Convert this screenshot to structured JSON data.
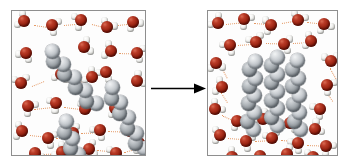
{
  "figure": {
    "title": "Hydrophobic effect: nonpolar chains aggregate in water",
    "background_color": "#ffffff",
    "width": 348,
    "height": 165
  },
  "colors": {
    "oxygen": "#94200f",
    "hydrogen": "#f3f3f1",
    "carbon": "#bcc1c6",
    "carbon_shaded": "#9ba1a6",
    "hydrogen_bond": "#e08a4e",
    "panel_border": "#8e8e8e",
    "panel_fill": "#fdfdfd",
    "arrow": "#000000"
  },
  "panels": [
    {
      "id": "panel-before",
      "name": "dispersed-state-panel",
      "label": "",
      "state": "dispersed",
      "chain_count": 3,
      "water_count": 28,
      "chains": [
        {
          "name": "chain-upper-left",
          "x": 38,
          "y": 42,
          "angle": 50,
          "beads": 9,
          "spacing": 8.6
        },
        {
          "name": "chain-right-middle",
          "x": 98,
          "y": 78,
          "angle": 62,
          "beads": 9,
          "spacing": 8.6
        },
        {
          "name": "chain-lower-center",
          "x": 52,
          "y": 112,
          "angle": 70,
          "beads": 9,
          "spacing": 8.6
        }
      ],
      "waters": [
        {
          "x": 12,
          "y": 10,
          "rot": 205
        },
        {
          "x": 40,
          "y": 14,
          "rot": 25
        },
        {
          "x": 69,
          "y": 9,
          "rot": 160
        },
        {
          "x": 95,
          "y": 16,
          "rot": 300
        },
        {
          "x": 121,
          "y": 11,
          "rot": 60
        },
        {
          "x": 14,
          "y": 42,
          "rot": 120
        },
        {
          "x": 72,
          "y": 36,
          "rot": 340
        },
        {
          "x": 99,
          "y": 40,
          "rot": 200
        },
        {
          "x": 125,
          "y": 42,
          "rot": 15
        },
        {
          "x": 9,
          "y": 72,
          "rot": 260
        },
        {
          "x": 49,
          "y": 63,
          "rot": 100
        },
        {
          "x": 80,
          "y": 66,
          "rot": 215
        },
        {
          "x": 125,
          "y": 70,
          "rot": 330
        },
        {
          "x": 16,
          "y": 95,
          "rot": 40
        },
        {
          "x": 44,
          "y": 92,
          "rot": 150
        },
        {
          "x": 73,
          "y": 98,
          "rot": 285
        },
        {
          "x": 103,
          "y": 97,
          "rot": 70
        },
        {
          "x": 10,
          "y": 120,
          "rot": 190
        },
        {
          "x": 36,
          "y": 127,
          "rot": 20
        },
        {
          "x": 61,
          "y": 122,
          "rot": 245
        },
        {
          "x": 88,
          "y": 119,
          "rot": 130
        },
        {
          "x": 118,
          "y": 120,
          "rot": 310
        },
        {
          "x": 23,
          "y": 142,
          "rot": 85
        },
        {
          "x": 50,
          "y": 141,
          "rot": 215
        },
        {
          "x": 77,
          "y": 138,
          "rot": 350
        },
        {
          "x": 104,
          "y": 142,
          "rot": 160
        },
        {
          "x": 127,
          "y": 132,
          "rot": 55
        },
        {
          "x": 94,
          "y": 61,
          "rot": 125
        }
      ],
      "hbonds": [
        {
          "x": 22,
          "y": 14,
          "len": 16,
          "angle": 8
        },
        {
          "x": 52,
          "y": 14,
          "len": 15,
          "angle": -5
        },
        {
          "x": 80,
          "y": 13,
          "len": 13,
          "angle": 14
        },
        {
          "x": 106,
          "y": 14,
          "len": 13,
          "angle": -6
        },
        {
          "x": 107,
          "y": 42,
          "len": 16,
          "angle": 2
        },
        {
          "x": 20,
          "y": 75,
          "len": 13,
          "angle": -22
        },
        {
          "x": 55,
          "y": 68,
          "len": 19,
          "angle": 9
        },
        {
          "x": 22,
          "y": 98,
          "len": 18,
          "angle": -6
        },
        {
          "x": 52,
          "y": 96,
          "len": 18,
          "angle": 7
        },
        {
          "x": 18,
          "y": 124,
          "len": 15,
          "angle": 6
        },
        {
          "x": 44,
          "y": 127,
          "len": 14,
          "angle": -4
        },
        {
          "x": 69,
          "y": 122,
          "len": 16,
          "angle": -2
        },
        {
          "x": 96,
          "y": 120,
          "len": 18,
          "angle": 2
        },
        {
          "x": 31,
          "y": 143,
          "len": 16,
          "angle": -2
        },
        {
          "x": 58,
          "y": 141,
          "len": 16,
          "angle": -3
        },
        {
          "x": 85,
          "y": 139,
          "len": 16,
          "angle": 5
        },
        {
          "x": 112,
          "y": 141,
          "len": 14,
          "angle": -14
        }
      ]
    },
    {
      "id": "panel-after",
      "name": "aggregated-state-panel",
      "label": "",
      "state": "aggregated",
      "chain_count": 3,
      "water_count": 28,
      "chains": [
        {
          "name": "chain-cluster-left",
          "x": 45,
          "y": 50,
          "angle": 92,
          "beads": 9,
          "spacing": 8.6
        },
        {
          "name": "chain-cluster-center",
          "x": 66,
          "y": 46,
          "angle": 90,
          "beads": 9,
          "spacing": 8.6
        },
        {
          "name": "chain-cluster-right",
          "x": 87,
          "y": 50,
          "angle": 88,
          "beads": 9,
          "spacing": 8.6
        }
      ],
      "waters": [
        {
          "x": 10,
          "y": 12,
          "rot": 220
        },
        {
          "x": 36,
          "y": 8,
          "rot": 40
        },
        {
          "x": 63,
          "y": 14,
          "rot": 170
        },
        {
          "x": 90,
          "y": 9,
          "rot": 290
        },
        {
          "x": 116,
          "y": 13,
          "rot": 70
        },
        {
          "x": 22,
          "y": 34,
          "rot": 130
        },
        {
          "x": 48,
          "y": 31,
          "rot": 250
        },
        {
          "x": 76,
          "y": 33,
          "rot": 10
        },
        {
          "x": 103,
          "y": 30,
          "rot": 195
        },
        {
          "x": 8,
          "y": 52,
          "rot": 85
        },
        {
          "x": 123,
          "y": 50,
          "rot": 265
        },
        {
          "x": 14,
          "y": 76,
          "rot": 200
        },
        {
          "x": 119,
          "y": 74,
          "rot": 35
        },
        {
          "x": 7,
          "y": 98,
          "rot": 315
        },
        {
          "x": 112,
          "y": 98,
          "rot": 145
        },
        {
          "x": 29,
          "y": 110,
          "rot": 60
        },
        {
          "x": 55,
          "y": 108,
          "rot": 230
        },
        {
          "x": 82,
          "y": 112,
          "rot": 105
        },
        {
          "x": 107,
          "y": 118,
          "rot": 330
        },
        {
          "x": 12,
          "y": 124,
          "rot": 180
        },
        {
          "x": 38,
          "y": 130,
          "rot": 25
        },
        {
          "x": 64,
          "y": 127,
          "rot": 255
        },
        {
          "x": 90,
          "y": 132,
          "rot": 140
        },
        {
          "x": 118,
          "y": 135,
          "rot": 45
        },
        {
          "x": 24,
          "y": 146,
          "rot": 215
        },
        {
          "x": 52,
          "y": 145,
          "rot": 95
        },
        {
          "x": 79,
          "y": 143,
          "rot": 345
        },
        {
          "x": 105,
          "y": 146,
          "rot": 165
        }
      ],
      "hbonds": [
        {
          "x": 18,
          "y": 13,
          "len": 17,
          "angle": -6
        },
        {
          "x": 46,
          "y": 12,
          "len": 16,
          "angle": 4
        },
        {
          "x": 74,
          "y": 12,
          "len": 15,
          "angle": -10
        },
        {
          "x": 99,
          "y": 11,
          "len": 16,
          "angle": 6
        },
        {
          "x": 30,
          "y": 34,
          "len": 17,
          "angle": -4
        },
        {
          "x": 58,
          "y": 32,
          "len": 17,
          "angle": 2
        },
        {
          "x": 85,
          "y": 32,
          "len": 17,
          "angle": -3
        },
        {
          "x": 14,
          "y": 57,
          "len": 11,
          "angle": 62
        },
        {
          "x": 122,
          "y": 57,
          "len": 12,
          "angle": 60
        },
        {
          "x": 13,
          "y": 81,
          "len": 12,
          "angle": 58
        },
        {
          "x": 118,
          "y": 80,
          "len": 12,
          "angle": 56
        },
        {
          "x": 14,
          "y": 104,
          "len": 14,
          "angle": 26
        },
        {
          "x": 37,
          "y": 112,
          "len": 17,
          "angle": -2
        },
        {
          "x": 64,
          "y": 111,
          "len": 17,
          "angle": 4
        },
        {
          "x": 20,
          "y": 127,
          "len": 17,
          "angle": 4
        },
        {
          "x": 47,
          "y": 130,
          "len": 16,
          "angle": -3
        },
        {
          "x": 73,
          "y": 129,
          "len": 16,
          "angle": 4
        },
        {
          "x": 99,
          "y": 134,
          "len": 18,
          "angle": 2
        },
        {
          "x": 32,
          "y": 147,
          "len": 19,
          "angle": -2
        },
        {
          "x": 60,
          "y": 145,
          "len": 18,
          "angle": -2
        },
        {
          "x": 87,
          "y": 145,
          "len": 17,
          "angle": 3
        }
      ]
    }
  ],
  "arrow": {
    "name": "reaction-arrow",
    "direction": "right",
    "label": "",
    "color": "#000000"
  },
  "legend": {
    "oxygen_label": "oxygen",
    "hydrogen_label": "hydrogen",
    "carbon_label": "carbon"
  }
}
